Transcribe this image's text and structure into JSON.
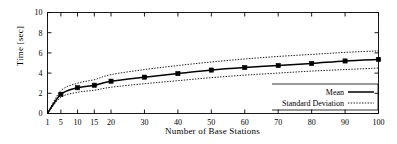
{
  "chart_data": {
    "type": "line",
    "title": "",
    "xlabel": "Number of Base Stations",
    "ylabel": "Time [sec]",
    "xlim": [
      1,
      100
    ],
    "ylim": [
      0,
      10
    ],
    "xticks": [
      1,
      5,
      10,
      15,
      20,
      30,
      40,
      50,
      60,
      70,
      80,
      90,
      100
    ],
    "yticks": [
      0,
      2,
      4,
      6,
      8,
      10
    ],
    "xtick_labels": [
      "1",
      "5",
      "10",
      "15",
      "20",
      "30",
      "40",
      "50",
      "60",
      "70",
      "80",
      "90",
      "100"
    ],
    "ytick_labels": [
      "0",
      "2",
      "4",
      "6",
      "8",
      "10"
    ],
    "grid": false,
    "legend_position": "bottom-right",
    "x": [
      1,
      5,
      10,
      15,
      20,
      30,
      40,
      50,
      60,
      70,
      80,
      90,
      100
    ],
    "series": [
      {
        "name": "Mean",
        "style": "solid",
        "marker": "square",
        "values": [
          0.0,
          1.9,
          2.55,
          2.8,
          3.2,
          3.6,
          3.95,
          4.3,
          4.55,
          4.75,
          4.95,
          5.2,
          5.35
        ]
      },
      {
        "name": "Standard Deviation Upper",
        "style": "dotted",
        "marker": "none",
        "values": [
          0.0,
          2.25,
          3.0,
          3.35,
          3.85,
          4.35,
          4.75,
          5.1,
          5.4,
          5.65,
          5.85,
          6.05,
          6.2
        ]
      },
      {
        "name": "Standard Deviation Lower",
        "style": "dotted",
        "marker": "none",
        "values": [
          0.0,
          1.6,
          2.1,
          2.3,
          2.6,
          2.95,
          3.25,
          3.55,
          3.8,
          4.0,
          4.2,
          4.35,
          4.5
        ]
      }
    ],
    "legend": [
      {
        "label": "Mean",
        "style": "solid"
      },
      {
        "label": "Standard Deviation",
        "style": "dotted"
      }
    ],
    "colors": {
      "line": "#000000",
      "axis": "#000000",
      "background": "#ffffff"
    }
  }
}
